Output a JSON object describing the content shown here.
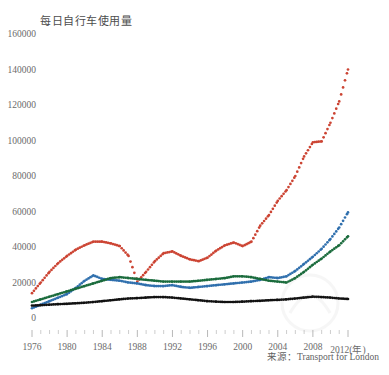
{
  "chart_data": {
    "type": "line",
    "title": "每日自行车使用量",
    "xlabel": "(年)",
    "ylabel": "",
    "source": "来源：Transport for London",
    "grid": false,
    "legend": "none",
    "xlim": [
      1976,
      2012
    ],
    "ylim": [
      0,
      160000
    ],
    "ytick_step": 20000,
    "xtick_step": 4,
    "ytick_labels": [
      "0",
      "20000",
      "40000",
      "60000",
      "80000",
      "100000",
      "120000",
      "140000",
      "160000"
    ],
    "xtick_labels": [
      "1976",
      "1980",
      "1984",
      "1988",
      "1992",
      "1996",
      "2000",
      "2004",
      "2008",
      "2012"
    ],
    "x": [
      1976,
      1977,
      1978,
      1979,
      1980,
      1981,
      1982,
      1983,
      1984,
      1985,
      1986,
      1987,
      1988,
      1989,
      1990,
      1991,
      1992,
      1993,
      1994,
      1995,
      1996,
      1997,
      1998,
      1999,
      2000,
      2001,
      2002,
      2003,
      2004,
      2005,
      2006,
      2007,
      2008,
      2009,
      2010,
      2011,
      2012
    ],
    "series": [
      {
        "name": "red-series",
        "color": "#cc4433",
        "values": [
          14000,
          20000,
          26000,
          31000,
          35000,
          38500,
          41000,
          43000,
          43000,
          42000,
          40500,
          35000,
          20500,
          26000,
          32000,
          36500,
          37500,
          35000,
          33000,
          32000,
          34000,
          38000,
          41000,
          42500,
          40500,
          43000,
          52000,
          58000,
          66000,
          72000,
          80000,
          91000,
          99000,
          99500,
          110000,
          122000,
          140000
        ]
      },
      {
        "name": "blue-series",
        "color": "#2f6fad",
        "values": [
          5500,
          7500,
          9500,
          11500,
          13500,
          17000,
          21000,
          24000,
          22000,
          21500,
          21000,
          20000,
          19500,
          18500,
          18000,
          18000,
          18500,
          17500,
          17000,
          17500,
          18000,
          18500,
          19000,
          19500,
          20000,
          20500,
          21500,
          23000,
          22500,
          23500,
          26500,
          30500,
          34500,
          39000,
          44500,
          51000,
          59500
        ]
      },
      {
        "name": "green-series",
        "color": "#1a6b3c",
        "values": [
          9000,
          10500,
          12000,
          13500,
          15000,
          16500,
          18000,
          19500,
          21000,
          22500,
          23000,
          22500,
          22000,
          21500,
          21000,
          20500,
          20500,
          20500,
          20500,
          21000,
          21500,
          22000,
          22500,
          23500,
          23500,
          23000,
          22000,
          21000,
          20500,
          20000,
          22500,
          26000,
          30000,
          33500,
          37500,
          41000,
          46000
        ]
      },
      {
        "name": "black-series",
        "color": "#111111",
        "values": [
          7000,
          7200,
          7500,
          7800,
          8000,
          8300,
          8600,
          9000,
          9500,
          10000,
          10500,
          11000,
          11200,
          11500,
          11800,
          11800,
          11500,
          11000,
          10500,
          10000,
          9500,
          9200,
          9000,
          9000,
          9200,
          9500,
          9700,
          10000,
          10200,
          10500,
          11000,
          11500,
          12000,
          11800,
          11500,
          11000,
          10700
        ]
      }
    ]
  }
}
